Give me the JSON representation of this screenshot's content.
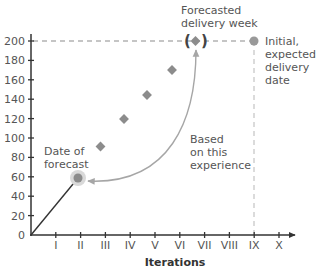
{
  "chart_data": {
    "type": "scatter",
    "title": "",
    "xlabel": "Iterations",
    "ylabel": "",
    "x_ticks": [
      "I",
      "II",
      "III",
      "IV",
      "V",
      "VI",
      "VII",
      "VIII",
      "IX",
      "X"
    ],
    "y_ticks": [
      0,
      20,
      40,
      60,
      80,
      100,
      120,
      140,
      160,
      180,
      200
    ],
    "ylim": [
      0,
      200
    ],
    "xlim": [
      0,
      10
    ],
    "grid": false,
    "series": [
      {
        "name": "Actual progress (line)",
        "type": "line",
        "points": [
          {
            "x": 0,
            "y": 0
          },
          {
            "x": 2,
            "y": 59
          }
        ]
      },
      {
        "name": "Date of forecast",
        "type": "point",
        "points": [
          {
            "x": 2,
            "y": 59
          }
        ]
      },
      {
        "name": "Projected progress",
        "type": "diamond",
        "points": [
          {
            "x": 3,
            "y": 91
          },
          {
            "x": 4,
            "y": 120
          },
          {
            "x": 5,
            "y": 145
          },
          {
            "x": 6,
            "y": 170
          }
        ]
      },
      {
        "name": "Forecasted delivery week",
        "type": "diamond",
        "points": [
          {
            "x": 6.6,
            "y": 200
          }
        ]
      },
      {
        "name": "Initial, expected delivery date",
        "type": "point",
        "points": [
          {
            "x": 9,
            "y": 200
          }
        ]
      }
    ],
    "reference_lines": [
      {
        "orientation": "horizontal",
        "y": 200,
        "style": "dashed",
        "x_from": 0,
        "x_to": 9
      },
      {
        "orientation": "vertical",
        "x": 9,
        "style": "dashed",
        "y_from": 0,
        "y_to": 200
      }
    ],
    "annotations": [
      {
        "text_lines": [
          "Forecasted",
          "delivery week"
        ],
        "anchor": "forecast-diamond"
      },
      {
        "text_lines": [
          "Initial,",
          "expected",
          "delivery",
          "date"
        ],
        "anchor": "initial-dot"
      },
      {
        "text_lines": [
          "Date of",
          "forecast"
        ],
        "anchor": "forecast-date-dot"
      },
      {
        "text_lines": [
          "Based",
          "on this",
          "experience"
        ],
        "anchor": "curved-arrow"
      }
    ],
    "colors": {
      "axis": "#333333",
      "marker": "#8c8c8c",
      "halo": "#d9d9d9",
      "dashed": "#b3b3b3",
      "arrow": "#a6a6a6",
      "text": "#555555"
    }
  },
  "labels": {
    "forecasted_1": "Forecasted",
    "forecasted_2": "delivery week",
    "initial_1": "Initial,",
    "initial_2": "expected",
    "initial_3": "delivery",
    "initial_4": "date",
    "date_of_1": "Date of",
    "date_of_2": "forecast",
    "based_1": "Based",
    "based_2": "on this",
    "based_3": "experience",
    "x_axis_title": "Iterations",
    "forecast_paren_left": "(",
    "forecast_paren_right": ")"
  }
}
